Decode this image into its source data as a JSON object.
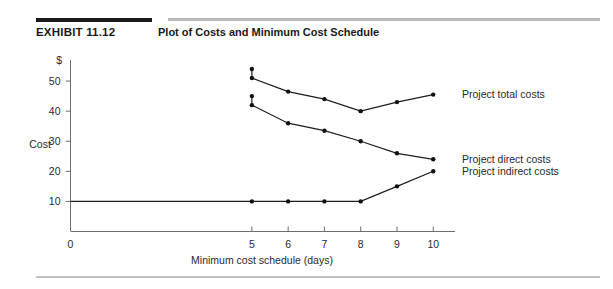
{
  "exhibit": {
    "label": "EXHIBIT 11.12",
    "title": "Plot of Costs and Minimum Cost Schedule"
  },
  "chart_data": {
    "type": "line",
    "title": "Plot of Costs and Minimum Cost Schedule",
    "xlabel": "Minimum cost schedule (days)",
    "ylabel": "Cost",
    "y_unit_label": "$",
    "x": [
      5,
      6,
      7,
      8,
      9,
      10
    ],
    "xlim": [
      0,
      10.6
    ],
    "ylim": [
      0,
      57
    ],
    "x_ticks": [
      0,
      5,
      6,
      7,
      8,
      9,
      10
    ],
    "x_tick_labels": [
      "0",
      "5",
      "6",
      "7",
      "8",
      "9",
      "10"
    ],
    "y_ticks": [
      10,
      20,
      30,
      40,
      50
    ],
    "y_tick_labels": [
      "10",
      "20",
      "30",
      "40",
      "50"
    ],
    "grid": false,
    "legend_position": "right-of-lines",
    "series": [
      {
        "name": "Project total costs",
        "values": [
          51,
          46.5,
          44,
          40,
          43,
          45.5
        ],
        "cap_marker": 54
      },
      {
        "name": "Project direct costs",
        "values": [
          42,
          36,
          33.5,
          30,
          26,
          24
        ],
        "cap_marker": 45
      },
      {
        "name": "Project indirect costs",
        "values": [
          10,
          10,
          10,
          10,
          15,
          20
        ],
        "cap_marker": null
      }
    ],
    "annotations": [
      "Total costs reach a minimum of 40 at 8 days",
      "Indirect costs are flat at 10 from 5 to 8 days"
    ]
  },
  "legend": {
    "items": [
      "Project total costs",
      "Project direct costs",
      "Project indirect costs"
    ]
  }
}
